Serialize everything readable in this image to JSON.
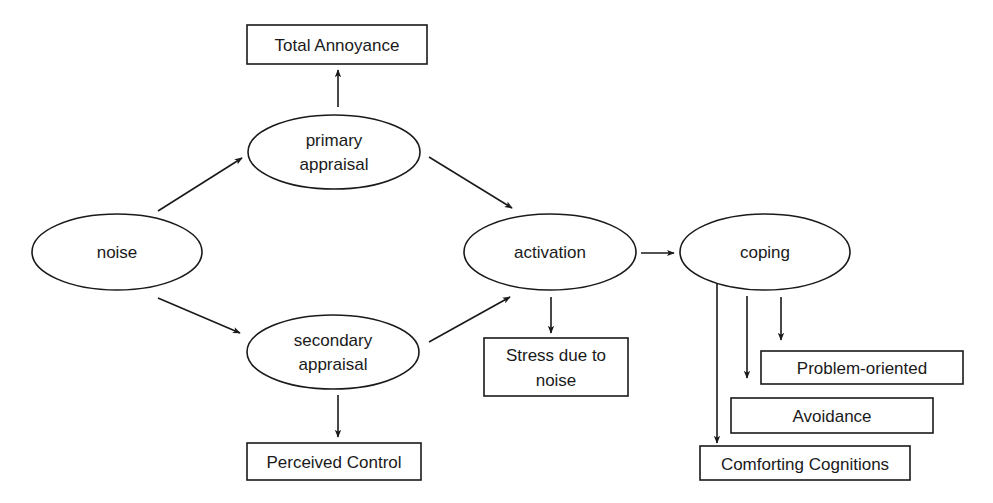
{
  "diagram": {
    "type": "flow",
    "nodes": {
      "noise": {
        "shape": "ellipse",
        "lines": [
          "noise"
        ]
      },
      "primary": {
        "shape": "ellipse",
        "lines": [
          "primary",
          "appraisal"
        ]
      },
      "secondary": {
        "shape": "ellipse",
        "lines": [
          "secondary",
          "appraisal"
        ]
      },
      "activation": {
        "shape": "ellipse",
        "lines": [
          "activation"
        ]
      },
      "coping": {
        "shape": "ellipse",
        "lines": [
          "coping"
        ]
      },
      "total_annoyance": {
        "shape": "box",
        "lines": [
          "Total Annoyance"
        ]
      },
      "perceived_control": {
        "shape": "box",
        "lines": [
          "Perceived Control"
        ]
      },
      "stress": {
        "shape": "box",
        "lines": [
          "Stress due to",
          "noise"
        ]
      },
      "problem_oriented": {
        "shape": "box",
        "lines": [
          "Problem-oriented"
        ]
      },
      "avoidance": {
        "shape": "box",
        "lines": [
          "Avoidance"
        ]
      },
      "comforting": {
        "shape": "box",
        "lines": [
          "Comforting Cognitions"
        ]
      }
    },
    "edges": [
      {
        "from": "noise",
        "to": "primary"
      },
      {
        "from": "noise",
        "to": "secondary"
      },
      {
        "from": "primary",
        "to": "total_annoyance"
      },
      {
        "from": "primary",
        "to": "activation"
      },
      {
        "from": "secondary",
        "to": "activation"
      },
      {
        "from": "secondary",
        "to": "perceived_control"
      },
      {
        "from": "activation",
        "to": "coping"
      },
      {
        "from": "activation",
        "to": "stress"
      },
      {
        "from": "coping",
        "to": "problem_oriented"
      },
      {
        "from": "coping",
        "to": "avoidance"
      },
      {
        "from": "coping",
        "to": "comforting"
      }
    ]
  }
}
